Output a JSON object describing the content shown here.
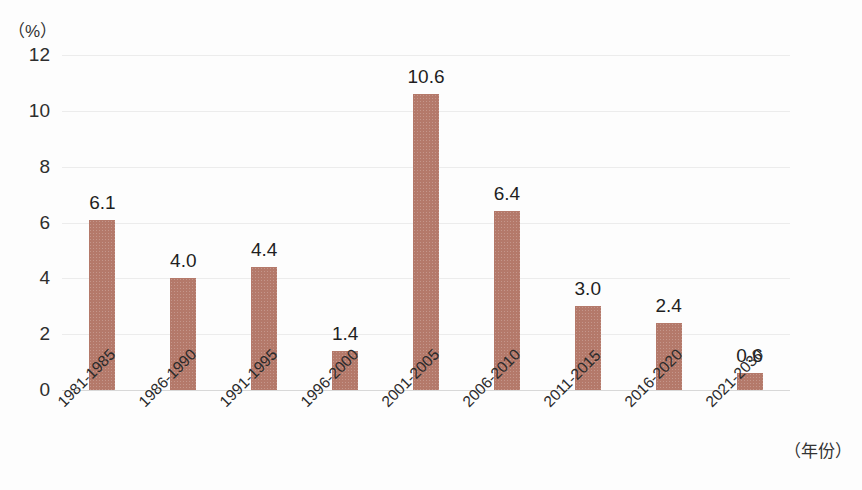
{
  "chart_data": {
    "type": "bar",
    "title": "",
    "subtitle": "",
    "xlabel": "（年份）",
    "ylabel": "（%）",
    "categories": [
      "1981-1985",
      "1986-1990",
      "1991-1995",
      "1996-2000",
      "2001-2005",
      "2006-2010",
      "2011-2015",
      "2016-2020",
      "2021-2030"
    ],
    "values": [
      6.1,
      4.0,
      4.4,
      1.4,
      10.6,
      6.4,
      3.0,
      2.4,
      0.6
    ],
    "value_labels": [
      "6.1",
      "4.0",
      "4.4",
      "1.4",
      "10.6",
      "6.4",
      "3.0",
      "2.4",
      "0.6"
    ],
    "ylim": [
      0,
      12
    ],
    "yticks": [
      0,
      2,
      4,
      6,
      8,
      10,
      12
    ],
    "ytick_labels": [
      "0",
      "2",
      "4",
      "6",
      "8",
      "10",
      "12"
    ],
    "grid": true,
    "legend": false,
    "legend_position": "none",
    "bar_color": "#b4796a",
    "gridline_color": "#ececec",
    "axis_color": "#d8d8d8",
    "text_color": "#2e2e2e",
    "background_color": "#fdfdfd"
  }
}
